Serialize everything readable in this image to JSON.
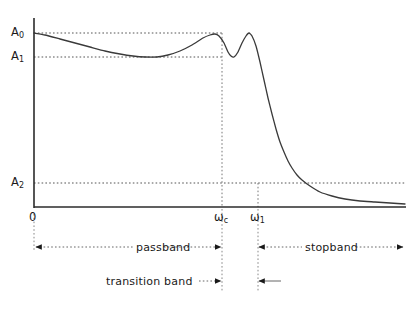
{
  "figure": {
    "background_color": "#ffffff",
    "line_color": "#3a3a3a",
    "axis_color": "#2b2b2b",
    "guide_color": "#555555"
  },
  "y_axis": {
    "labels": [
      {
        "id": "A0",
        "text": "A",
        "sub": "0",
        "value_y": 33
      },
      {
        "id": "A1",
        "text": "A",
        "sub": "1",
        "value_y": 57
      },
      {
        "id": "A2",
        "text": "A",
        "sub": "2",
        "value_y": 183
      }
    ]
  },
  "x_axis": {
    "origin_label": "0",
    "labels": [
      {
        "id": "wc",
        "text": "ω",
        "sub": "c",
        "value_x": 222
      },
      {
        "id": "w1",
        "text": "ω",
        "sub": "1",
        "value_x": 258
      }
    ]
  },
  "bands": [
    {
      "id": "passband",
      "label": "passband",
      "from": "0",
      "to": "ωc"
    },
    {
      "id": "stopband",
      "label": "stopband",
      "from": "ω1",
      "to": "end"
    },
    {
      "id": "transition_band",
      "label": "transition band",
      "from": "ωc",
      "to": "ω1"
    }
  ],
  "chart_data": {
    "type": "line",
    "title": "",
    "xlabel": "",
    "ylabel": "",
    "grid": false,
    "legend": null,
    "axis_ranges": {
      "x": [
        0,
        411
      ],
      "y": [
        0,
        1
      ]
    },
    "reference_levels": [
      {
        "name": "A0",
        "y_px": 33
      },
      {
        "name": "A1",
        "y_px": 57
      },
      {
        "name": "A2",
        "y_px": 183
      }
    ],
    "reference_frequencies": [
      {
        "name": "wc",
        "x_px": 222
      },
      {
        "name": "w1",
        "x_px": 258
      }
    ],
    "series": [
      {
        "name": "magnitude response",
        "points_px": [
          [
            34,
            33
          ],
          [
            45,
            35
          ],
          [
            60,
            39
          ],
          [
            75,
            43
          ],
          [
            90,
            47
          ],
          [
            105,
            51
          ],
          [
            120,
            54
          ],
          [
            133,
            56
          ],
          [
            145,
            57
          ],
          [
            157,
            57
          ],
          [
            168,
            55
          ],
          [
            180,
            51
          ],
          [
            192,
            45
          ],
          [
            203,
            38
          ],
          [
            210,
            35
          ],
          [
            215,
            34
          ],
          [
            219,
            36
          ],
          [
            224,
            43
          ],
          [
            228,
            52
          ],
          [
            231,
            56
          ],
          [
            234,
            57
          ],
          [
            238,
            52
          ],
          [
            242,
            43
          ],
          [
            246,
            36
          ],
          [
            249,
            33
          ],
          [
            252,
            36
          ],
          [
            256,
            46
          ],
          [
            260,
            62
          ],
          [
            264,
            80
          ],
          [
            268,
            98
          ],
          [
            272,
            114
          ],
          [
            276,
            129
          ],
          [
            280,
            142
          ],
          [
            284,
            152
          ],
          [
            288,
            161
          ],
          [
            292,
            168
          ],
          [
            297,
            175
          ],
          [
            302,
            180
          ],
          [
            310,
            186
          ],
          [
            320,
            192
          ],
          [
            332,
            196
          ],
          [
            345,
            199
          ],
          [
            360,
            201
          ],
          [
            375,
            202
          ],
          [
            390,
            203
          ],
          [
            405,
            204
          ]
        ]
      }
    ]
  }
}
